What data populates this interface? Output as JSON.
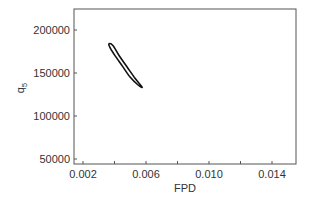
{
  "chart_data": {
    "type": "line",
    "title": "",
    "xlabel": "FPD",
    "ylabel": "q5",
    "ylabel_main": "q",
    "ylabel_sub": "5",
    "xlim": [
      0.0015,
      0.0155
    ],
    "ylim": [
      45000,
      225000
    ],
    "xticks": [
      0.002,
      0.004,
      0.006,
      0.008,
      0.01,
      0.012,
      0.014
    ],
    "xtick_labels": [
      "0.002",
      "",
      "0.006",
      "",
      "0.010",
      "",
      "0.014"
    ],
    "yticks": [
      50000,
      100000,
      150000,
      200000
    ],
    "ytick_labels": [
      "50000",
      "100000",
      "150000",
      "200000"
    ],
    "grid": false,
    "legend": null,
    "series": [
      {
        "name": "confidence contour (closed curve)",
        "closed": true,
        "x": [
          0.00365,
          0.0039,
          0.0043,
          0.0048,
          0.0053,
          0.00575,
          0.0055,
          0.005,
          0.0045,
          0.004,
          0.0037,
          0.00365
        ],
        "y": [
          184000,
          182000,
          170000,
          157000,
          144000,
          133500,
          136000,
          145000,
          158000,
          171000,
          180000,
          184000
        ]
      }
    ]
  }
}
